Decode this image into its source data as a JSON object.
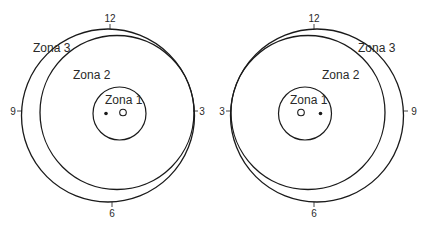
{
  "figures": [
    {
      "id": "left",
      "zones": {
        "zone1": "Zona 1",
        "zone2": "Zona 2",
        "zone3": "Zona 3"
      },
      "clock": {
        "top": "12",
        "left": "9",
        "right": "3",
        "bottom": "6"
      }
    },
    {
      "id": "right",
      "zones": {
        "zone1": "Zona 1",
        "zone2": "Zona 2",
        "zone3": "Zona 3"
      },
      "clock": {
        "top": "12",
        "left": "3",
        "right": "9",
        "bottom": "6"
      }
    }
  ],
  "colors": {
    "stroke": "#1a1a1a",
    "text": "#2a2a2a"
  }
}
